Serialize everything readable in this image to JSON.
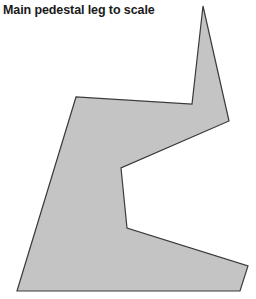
{
  "title": "Main pedestal leg to scale",
  "shape": {
    "name": "pedestal-leg-outline",
    "fill": "#c4c4c4",
    "stroke": "#3a3a3a",
    "points": "203,6 229,121 121,168 127,228 248,266 240,291 17,291 76,97 192,104"
  }
}
